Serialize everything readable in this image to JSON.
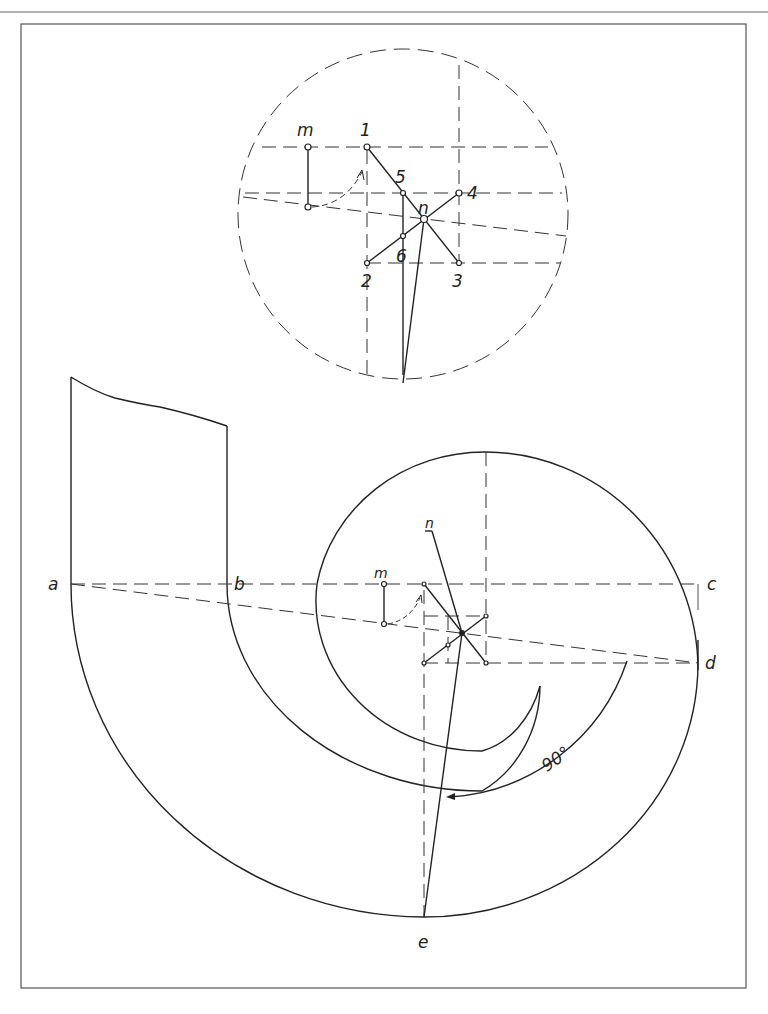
{
  "figure": {
    "type": "technical drawing",
    "colors": {
      "line": "#222222",
      "background": "#ffffff"
    }
  },
  "detail_circle": {
    "labels": {
      "m": "m",
      "p1": "1",
      "p2": "2",
      "p3": "3",
      "p4": "4",
      "p5": "5",
      "p6": "6",
      "n": "n"
    }
  },
  "main_drawing": {
    "labels": {
      "a": "a",
      "b": "b",
      "c": "c",
      "d": "d",
      "e": "e",
      "m": "m",
      "n": "n",
      "angle": "90°"
    }
  }
}
